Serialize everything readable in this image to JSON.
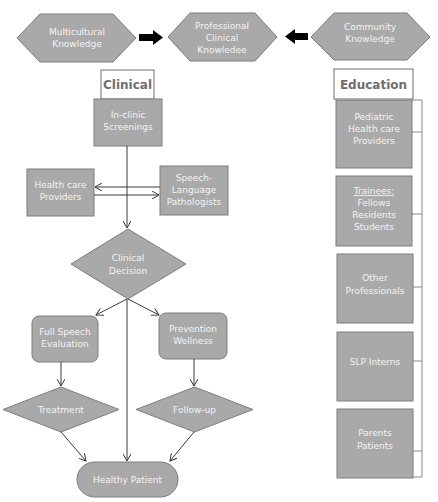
{
  "top_row": {
    "left": {
      "line1": "Multicultural",
      "line2": "Knowledge"
    },
    "center": {
      "line1": "Professional",
      "line2": "Clinical",
      "line3": "Knowledee"
    },
    "right": {
      "line1": "Community",
      "line2": "Knowledge"
    }
  },
  "clinical": {
    "header": "Clinical",
    "screenings": {
      "line1": "In-clinic",
      "line2": "Screenings"
    },
    "providers": {
      "line1": "Health care",
      "line2": "Providers"
    },
    "slp": {
      "line1": "Speech-",
      "line2": "Language",
      "line3": "Pathologists"
    },
    "decision": {
      "line1": "Clinical",
      "line2": "Decision"
    },
    "evaluation": {
      "line1": "Full Speech",
      "line2": "Evaluation"
    },
    "prevention": {
      "line1": "Prevention",
      "line2": "Wellness"
    },
    "treatment": "Treatment",
    "followup": "Follow-up",
    "outcome": "Healthy Patient"
  },
  "education": {
    "header": "Education",
    "items": [
      {
        "lines": [
          "Pediatric",
          "Health care",
          "Providers"
        ]
      },
      {
        "title": "Trainees:",
        "lines": [
          "Fellows",
          "Residents",
          "Students"
        ]
      },
      {
        "lines": [
          "Other",
          "Professionals"
        ]
      },
      {
        "lines": [
          "SLP Interns"
        ]
      },
      {
        "lines": [
          "Parents",
          "Patients"
        ]
      }
    ]
  },
  "colors": {
    "shape_fill": "#a9a9a9",
    "shape_stroke": "#7d7d7d",
    "text": "#f4f4f4",
    "header_text": "#6e6e6e",
    "arrow": "#000000"
  }
}
